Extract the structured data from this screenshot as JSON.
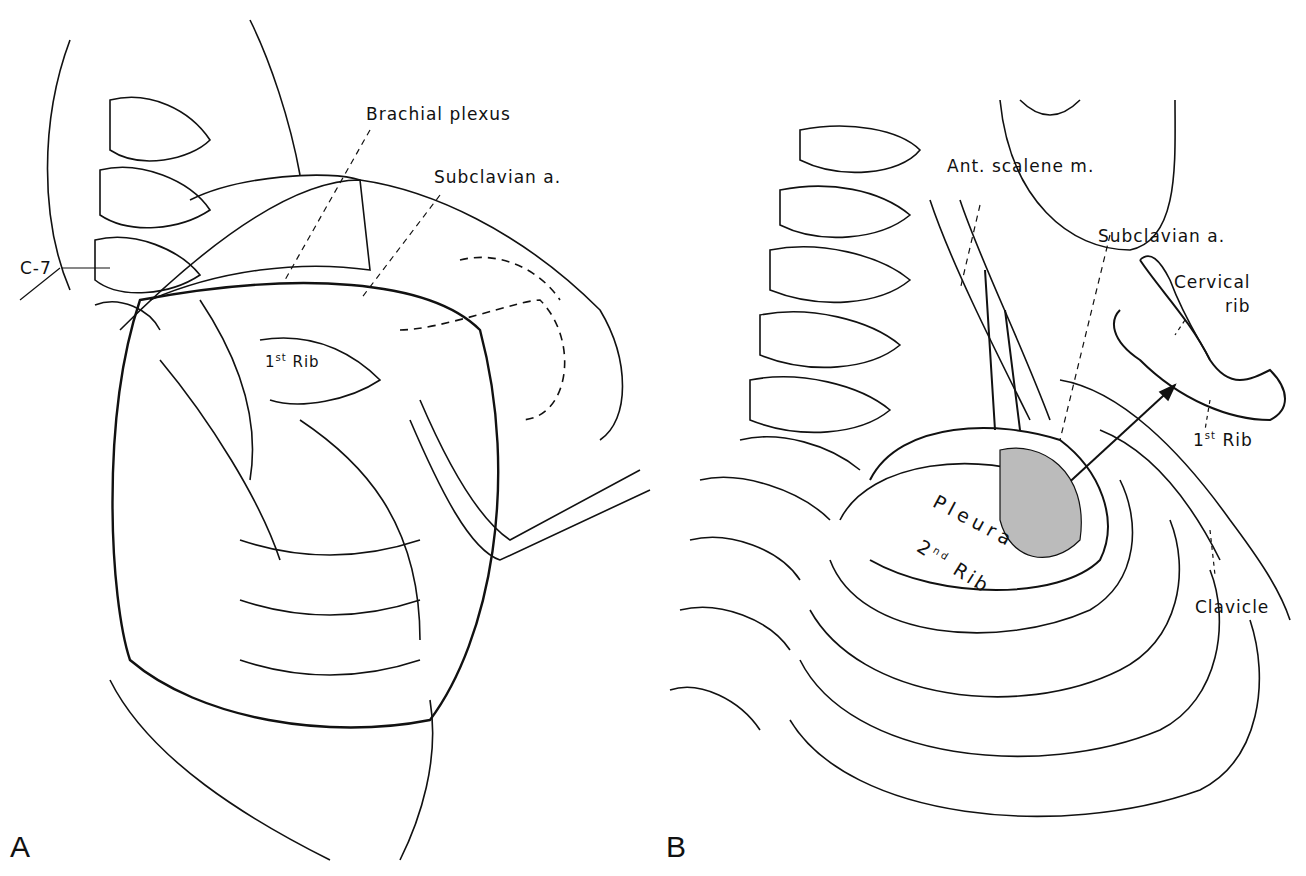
{
  "figure": {
    "panels": [
      {
        "letter": "A",
        "labels": {
          "brachial_plexus": "Brachial plexus",
          "subclavian_a": "Subclavian a.",
          "c7": "C-7",
          "first_rib_num": "1",
          "first_rib_sup": "st",
          "first_rib_word": "Rib"
        }
      },
      {
        "letter": "B",
        "labels": {
          "ant_scalene": "Ant. scalene m.",
          "subclavian_a": "Subclavian a.",
          "cervical_rib_line1": "Cervical",
          "cervical_rib_line2": "rib",
          "first_rib_num": "1",
          "first_rib_sup": "st",
          "first_rib_word": "Rib",
          "pleura": "Pleura",
          "second_rib_num": "2",
          "second_rib_sup": "nd",
          "second_rib_word": "Rib",
          "clavicle": "Clavicle"
        }
      }
    ]
  }
}
